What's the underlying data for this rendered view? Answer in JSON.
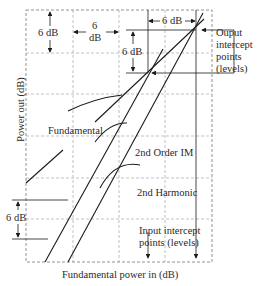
{
  "diagram": {
    "xlabel": "Fundamental power in (dB)",
    "ylabel": "Power out (dB)",
    "curves": {
      "fundamental": "Fundamental",
      "im2": "2nd Order IM",
      "harmonic2": "2nd Harmonic"
    },
    "annotations": {
      "top_left_vertical": "6 dB",
      "top_horizontal_num": "6",
      "top_horizontal_unit": "dB",
      "top_right_horizontal": "6 dB",
      "mid_vertical": "6 dB",
      "bottom_left_vertical": "6 dB",
      "output_intercept_line1": "Ouput",
      "output_intercept_line2": "intercept",
      "output_intercept_line3": "points",
      "output_intercept_line4": "(levels)",
      "input_intercept_line1": "Input intercept",
      "input_intercept_line2": "points (levels)"
    },
    "colors": {
      "line": "#1a1a1a",
      "grid": "#8a8a8a",
      "background": "#ffffff"
    }
  }
}
